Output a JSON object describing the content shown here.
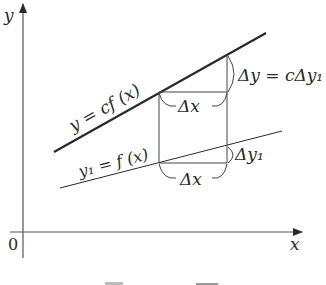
{
  "diagram": {
    "axes": {
      "x_label": "x",
      "y_label": "y",
      "origin_label": "0"
    },
    "curves": [
      {
        "id": "scaled",
        "label": "y = cf (x)",
        "style": "thick"
      },
      {
        "id": "base",
        "label": "y₁ = f (x)",
        "style": "thin"
      }
    ],
    "annotations": {
      "upper_dx": "Δx",
      "lower_dx": "Δx",
      "dy": "Δy = cΔy₁",
      "dy1": "Δy₁"
    },
    "colors": {
      "line": "#2a2a2a",
      "axis": "#555555",
      "background": "#ffffff"
    }
  }
}
